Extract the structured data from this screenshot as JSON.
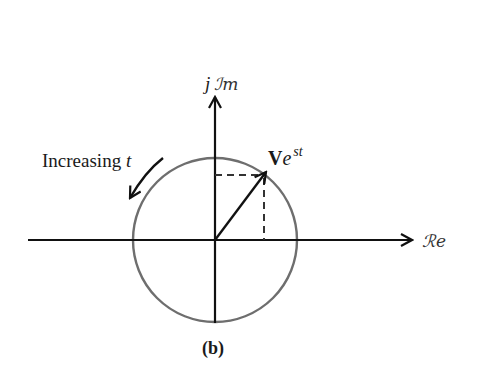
{
  "diagram": {
    "type": "phasor-complex-plane",
    "caption": "(b)",
    "axes": {
      "real_label": "ℛe",
      "imag_label_prefix": "j",
      "imag_label": "ℐm"
    },
    "phasor": {
      "label_main": "V",
      "label_exp": "e",
      "label_sup": "st"
    },
    "rotation_annotation": {
      "text": "Increasing ",
      "var": "t"
    },
    "colors": {
      "axes": "#111111",
      "circle": "#6e6e6e",
      "phasor": "#111111",
      "dashed": "#333333",
      "text": "#1a1a1a"
    }
  }
}
